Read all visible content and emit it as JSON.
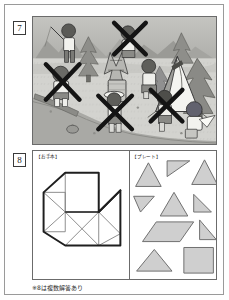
{
  "page": {
    "background": "#ffffff",
    "border_color": "#9a9a9a",
    "footer_note": "※8は複数解答あり"
  },
  "questions": [
    {
      "number": "7",
      "type": "illustration",
      "description": "camping scene with crossed-out children",
      "scene": {
        "setting": "campsite",
        "sky_color": "#b9b9b5",
        "ground_color": "#d2d2ce",
        "river_color": "#a8a8a4",
        "tent_color": "#f2f2ee",
        "marks": "black X crosses over five figures",
        "mark_color": "#161616"
      }
    },
    {
      "number": "8",
      "type": "tangram",
      "left_label": "【お手本】",
      "right_label": "【プレート】",
      "outline_color": "#1f1f1f",
      "inner_line_color": "#7d7d7d",
      "plate_fill": "#cfcfcf",
      "plate_stroke": "#6f6f6f",
      "plates": [
        {
          "name": "triangle-large-1",
          "shape": "triangle"
        },
        {
          "name": "triangle-right-top",
          "shape": "right-triangle"
        },
        {
          "name": "triangle-large-2",
          "shape": "triangle"
        },
        {
          "name": "triangle-right-left",
          "shape": "right-triangle"
        },
        {
          "name": "triangle-large-3",
          "shape": "triangle"
        },
        {
          "name": "triangle-right-mid",
          "shape": "right-triangle"
        },
        {
          "name": "parallelogram",
          "shape": "parallelogram"
        },
        {
          "name": "triangle-right-small",
          "shape": "right-triangle"
        },
        {
          "name": "triangle-wide-bottom",
          "shape": "triangle"
        },
        {
          "name": "square",
          "shape": "square"
        }
      ]
    }
  ]
}
